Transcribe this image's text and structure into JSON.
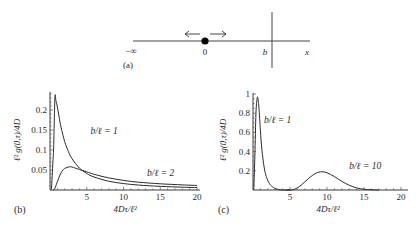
{
  "panel_a": {
    "label": "(a)",
    "minus_infinity": "−∞",
    "origin_label": "0",
    "barrier_label": "b",
    "axis_label": "x",
    "line_color": "#444444",
    "particle_color": "#000000"
  },
  "chart_data": [
    {
      "panel": "(b)",
      "type": "line",
      "title": "",
      "xlabel": "4Dτ/ℓ²",
      "ylabel": "ℓ² g(0,τ)/4D",
      "xlim": [
        0,
        20
      ],
      "ylim": [
        0,
        0.24
      ],
      "xticks": [
        5,
        10,
        15,
        20
      ],
      "yticks": [
        0.05,
        0.1,
        0.15,
        0.2
      ],
      "xtick_labels": [
        "5",
        "10",
        "15",
        "20"
      ],
      "ytick_labels": [
        "0.05",
        "0.1",
        "0.15",
        "0.2"
      ],
      "grid": false,
      "legend": "none (inline annotations)",
      "series": [
        {
          "name": "b/ℓ = 1",
          "x": [
            0.1,
            0.2,
            0.3,
            0.4,
            0.5,
            0.667,
            0.8,
            1,
            1.25,
            1.5,
            2,
            2.5,
            3,
            4,
            5,
            6,
            8,
            10,
            12,
            15,
            18,
            20
          ],
          "y": [
            0.0,
            0.0043,
            0.0369,
            0.0726,
            0.1082,
            0.2308,
            0.2236,
            0.2076,
            0.1813,
            0.1572,
            0.1209,
            0.0963,
            0.078,
            0.0548,
            0.0413,
            0.0325,
            0.0219,
            0.0161,
            0.0124,
            0.0091,
            0.007,
            0.006
          ]
        },
        {
          "name": "b/ℓ = 2",
          "x": [
            0.4,
            0.6,
            0.8,
            1,
            1.5,
            2,
            2.667,
            3,
            4,
            5,
            6,
            8,
            10,
            12,
            15,
            18,
            20
          ],
          "y": [
            0.0,
            0.0018,
            0.0105,
            0.0207,
            0.0428,
            0.054,
            0.0578,
            0.0574,
            0.0513,
            0.0455,
            0.0392,
            0.0302,
            0.0241,
            0.0196,
            0.0155,
            0.0128,
            0.0113
          ]
        }
      ],
      "annotations": [
        {
          "text": "b/ℓ = 1",
          "x": 5.5,
          "y": 0.14
        },
        {
          "text": "b/ℓ = 2",
          "x": 13.2,
          "y": 0.035
        }
      ]
    },
    {
      "panel": "(c)",
      "type": "line",
      "title": "",
      "xlabel": "4Dτ/ℓ²",
      "ylabel": "ℓ² g(0,τ)/4D",
      "xlim": [
        0,
        21
      ],
      "ylim": [
        0,
        1.0
      ],
      "xticks": [
        5,
        10,
        15,
        20
      ],
      "yticks": [
        0.2,
        0.4,
        0.6,
        0.8,
        1
      ],
      "xtick_labels": [
        "5",
        "10",
        "15",
        "20"
      ],
      "ytick_labels": [
        "0.2",
        "0.4",
        "0.6",
        "0.8",
        "1"
      ],
      "grid": false,
      "legend": "none (inline annotations)",
      "series": [
        {
          "name": "b/ℓ = 1",
          "x": [
            0.1,
            0.25,
            0.4,
            0.55,
            0.65,
            0.8,
            1.0,
            1.2,
            1.5,
            1.8,
            2.2,
            2.6,
            3.0,
            3.5,
            4.0,
            5.0
          ],
          "y": [
            0.0,
            0.35,
            0.8,
            0.95,
            0.96,
            0.86,
            0.62,
            0.42,
            0.24,
            0.14,
            0.07,
            0.035,
            0.015,
            0.005,
            0.0,
            0.0
          ]
        },
        {
          "name": "b/ℓ = 10",
          "x": [
            4.5,
            5.5,
            6.5,
            7.5,
            8.5,
            9.3,
            10,
            11,
            12,
            13,
            14,
            15,
            16,
            17
          ],
          "y": [
            0.0,
            0.005,
            0.05,
            0.12,
            0.175,
            0.19,
            0.18,
            0.14,
            0.09,
            0.05,
            0.022,
            0.008,
            0.002,
            0.0
          ]
        }
      ],
      "annotations": [
        {
          "text": "b/ℓ = 1",
          "x": 1.5,
          "y": 0.7
        },
        {
          "text": "b/ℓ = 10",
          "x": 13,
          "y": 0.22
        }
      ]
    }
  ],
  "panels": {
    "b": {
      "label": "(b)"
    },
    "c": {
      "label": "(c)"
    }
  }
}
